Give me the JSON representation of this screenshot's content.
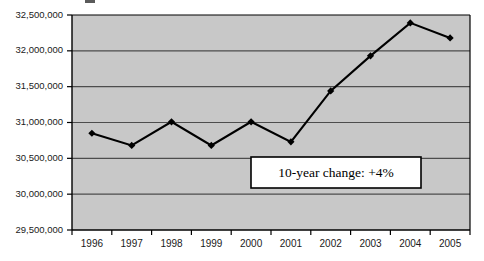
{
  "figure": {
    "title_fragment": "",
    "background_color": "#ffffff",
    "plot_background_color": "#c8c8c8",
    "plot_border_color": "#000000",
    "gridline_color": "#4d4d4d",
    "series_color": "#000000",
    "annotation_fill": "#ffffff",
    "annotation_border": "#000000"
  },
  "chart_data": {
    "type": "line",
    "title": "",
    "xlabel": "",
    "ylabel": "",
    "categories": [
      "1996",
      "1997",
      "1998",
      "1999",
      "2000",
      "2001",
      "2002",
      "2003",
      "2004",
      "2005"
    ],
    "values": [
      30850000,
      30680000,
      31010000,
      30680000,
      31010000,
      30730000,
      31440000,
      31930000,
      32390000,
      32180000
    ],
    "series": [
      {
        "name": "Total",
        "values": [
          30850000,
          30680000,
          31010000,
          30680000,
          31010000,
          30730000,
          31440000,
          31930000,
          32390000,
          32180000
        ],
        "marker": "diamond",
        "color": "#000000"
      }
    ],
    "ylim": [
      29500000,
      32500000
    ],
    "ytick_values": [
      29500000,
      30000000,
      30500000,
      31000000,
      31500000,
      32000000,
      32500000
    ],
    "ytick_labels": [
      "29,500,000",
      "30,000,000",
      "30,500,000",
      "31,000,000",
      "31,500,000",
      "32,000,000",
      "32,500,000"
    ],
    "xtick_labels": [
      "1996",
      "1997",
      "1998",
      "1999",
      "2000",
      "2001",
      "2002",
      "2003",
      "2004",
      "2005"
    ],
    "grid": {
      "horizontal": true,
      "vertical": false
    },
    "legend": {
      "visible": false,
      "position": "none"
    },
    "annotations": [
      {
        "text": "10-year change: +4%",
        "kind": "text-box",
        "x_anchor": 2001.5,
        "y_anchor": 30370000
      }
    ]
  }
}
